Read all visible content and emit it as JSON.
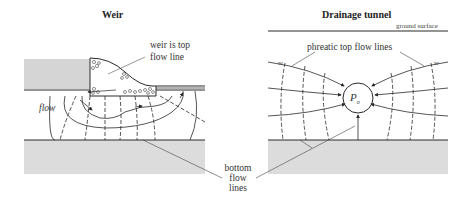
{
  "panels": {
    "left": {
      "title": "Weir",
      "labels": {
        "top_flow_line": "weir is top flow line",
        "top_flow_line_l1": "weir is top",
        "top_flow_line_l2": "flow line",
        "flow": "flow"
      }
    },
    "right": {
      "title": "Drainage tunnel",
      "labels": {
        "ground_surface": "ground surface",
        "phreatic": "phreatic top flow lines",
        "w_left": "w",
        "w_right": "w",
        "pressure_symbol": "P",
        "pressure_subscript": "o"
      }
    }
  },
  "shared_labels": {
    "bottom_flow_lines_l1": "bottom",
    "bottom_flow_lines_l2": "flow",
    "bottom_flow_lines_l3": "lines"
  },
  "colors": {
    "line": "#2a2a2a",
    "ground_fill": "#dcdcdc",
    "background": "#ffffff"
  }
}
